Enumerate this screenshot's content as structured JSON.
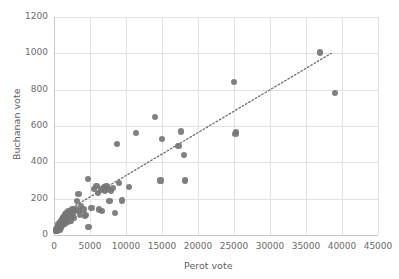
{
  "chart_data": {
    "type": "scatter",
    "title": "",
    "xlabel": "Perot  vote",
    "ylabel": "Buchanan vote",
    "xlim": [
      0,
      45000
    ],
    "ylim": [
      0,
      1200
    ],
    "xticks": [
      0,
      5000,
      10000,
      15000,
      20000,
      25000,
      30000,
      35000,
      40000,
      45000
    ],
    "yticks": [
      0,
      200,
      400,
      600,
      800,
      1000,
      1200
    ],
    "xtick_labels": [
      "0",
      "5000",
      "10000",
      "15000",
      "20000",
      "25000",
      "30000",
      "35000",
      "40000",
      "45000"
    ],
    "ytick_labels": [
      "0",
      "200",
      "400",
      "600",
      "800",
      "1000",
      "1200"
    ],
    "grid": true,
    "legend": "none",
    "marker_color": "#757575",
    "grid_color": "#e2e2e2",
    "trendline": {
      "style": "dotted",
      "color": "#6e6e6e",
      "x": [
        1200,
        38500
      ],
      "y": [
        120,
        1000
      ]
    },
    "points": [
      [
        270,
        20
      ],
      [
        320,
        30
      ],
      [
        360,
        25
      ],
      [
        420,
        40
      ],
      [
        470,
        22
      ],
      [
        500,
        50
      ],
      [
        560,
        35
      ],
      [
        600,
        60
      ],
      [
        650,
        45
      ],
      [
        700,
        55
      ],
      [
        760,
        30
      ],
      [
        800,
        70
      ],
      [
        860,
        48
      ],
      [
        900,
        65
      ],
      [
        950,
        40
      ],
      [
        1000,
        75
      ],
      [
        1050,
        58
      ],
      [
        1100,
        85
      ],
      [
        1150,
        50
      ],
      [
        1200,
        90
      ],
      [
        1250,
        68
      ],
      [
        1320,
        100
      ],
      [
        1400,
        78
      ],
      [
        1480,
        110
      ],
      [
        1550,
        62
      ],
      [
        1620,
        95
      ],
      [
        1700,
        120
      ],
      [
        1780,
        88
      ],
      [
        1850,
        105
      ],
      [
        1930,
        72
      ],
      [
        2000,
        130
      ],
      [
        2100,
        98
      ],
      [
        2200,
        115
      ],
      [
        2300,
        80
      ],
      [
        2400,
        125
      ],
      [
        2500,
        140
      ],
      [
        2650,
        108
      ],
      [
        2800,
        95
      ],
      [
        2950,
        132
      ],
      [
        3100,
        145
      ],
      [
        3200,
        185
      ],
      [
        3400,
        225
      ],
      [
        3500,
        130
      ],
      [
        3600,
        112
      ],
      [
        3750,
        160
      ],
      [
        4100,
        140
      ],
      [
        4300,
        105
      ],
      [
        4500,
        110
      ],
      [
        4700,
        310
      ],
      [
        4800,
        45
      ],
      [
        5200,
        150
      ],
      [
        5600,
        255
      ],
      [
        5900,
        270
      ],
      [
        6100,
        230
      ],
      [
        6300,
        140
      ],
      [
        6500,
        250
      ],
      [
        6700,
        130
      ],
      [
        6900,
        265
      ],
      [
        7100,
        245
      ],
      [
        7300,
        270
      ],
      [
        7500,
        255
      ],
      [
        7700,
        185
      ],
      [
        7900,
        240
      ],
      [
        8200,
        260
      ],
      [
        8500,
        120
      ],
      [
        8700,
        500
      ],
      [
        9000,
        285
      ],
      [
        9400,
        190
      ],
      [
        10400,
        265
      ],
      [
        11400,
        560
      ],
      [
        14000,
        648
      ],
      [
        14800,
        300
      ],
      [
        15000,
        530
      ],
      [
        17300,
        490
      ],
      [
        17600,
        570
      ],
      [
        18100,
        440
      ],
      [
        18200,
        300
      ],
      [
        25000,
        840
      ],
      [
        25200,
        555
      ],
      [
        25300,
        565
      ],
      [
        37000,
        1005
      ],
      [
        39000,
        780
      ]
    ]
  }
}
